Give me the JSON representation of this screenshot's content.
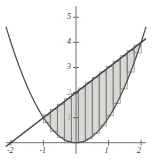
{
  "figure": {
    "name": "area-between-curves-riemann-strips",
    "background_color": "#ffffff"
  },
  "chart_data": {
    "type": "line",
    "title": "",
    "xlabel": "",
    "ylabel": "",
    "xlim": [
      -2.15,
      2.15
    ],
    "ylim": [
      -0.45,
      5.45
    ],
    "grid": false,
    "legend": null,
    "x_ticks": [
      -2,
      -1,
      1,
      2
    ],
    "x_tick_labels": [
      "-2",
      "-1",
      "1",
      "2"
    ],
    "y_ticks": [
      1,
      2,
      3,
      4,
      5
    ],
    "y_tick_labels": [
      "1",
      "2",
      "3",
      "4",
      "5"
    ],
    "axis_color": "#6b6b6b",
    "curve_color": "#4a4a52",
    "fill_color": "#d9d9d4",
    "strip_color": "#8f8f8f",
    "series": [
      {
        "name": "parabola",
        "equation": "y = x^2",
        "color": "#4a4a52",
        "x": [
          -2.0,
          -1.8,
          -1.6,
          -1.4,
          -1.2,
          -1.0,
          -0.8,
          -0.6,
          -0.4,
          -0.2,
          0.0,
          0.2,
          0.4,
          0.6,
          0.8,
          1.0,
          1.2,
          1.4,
          1.6,
          1.8,
          2.0
        ],
        "values": [
          4.0,
          3.24,
          2.56,
          1.96,
          1.44,
          1.0,
          0.64,
          0.36,
          0.16,
          0.04,
          0.0,
          0.04,
          0.16,
          0.36,
          0.64,
          1.0,
          1.44,
          1.96,
          2.56,
          3.24,
          4.0
        ]
      },
      {
        "name": "line",
        "equation": "y = x + 2",
        "color": "#3c3c44",
        "x": [
          -2.0,
          2.0
        ],
        "values": [
          0.0,
          4.0
        ]
      }
    ],
    "shaded_region": {
      "description": "region between y = x + 2 (upper) and y = x^2 (lower)",
      "x_from": -1.0,
      "x_to": 2.0,
      "upper_curve": "line",
      "lower_curve": "parabola",
      "fill_color": "#d9d9d4"
    },
    "riemann_strips": {
      "orientation": "vertical",
      "count": 14,
      "x_from": -1.0,
      "x_to": 2.0,
      "color": "#8f8f8f"
    },
    "intersections": [
      {
        "x": -1,
        "y": 1
      },
      {
        "x": 2,
        "y": 4
      }
    ]
  }
}
